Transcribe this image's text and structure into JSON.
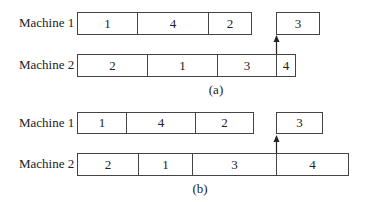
{
  "diagrams": [
    {
      "caption": "(a)",
      "machines": [
        {
          "label": "Machine 1",
          "jobs": [
            "1",
            "4",
            "2"
          ],
          "late_job": "3"
        },
        {
          "label": "Machine 2",
          "jobs": [
            "2",
            "1",
            "3",
            "4"
          ]
        }
      ]
    },
    {
      "caption": "(b)",
      "machines": [
        {
          "label": "Machine 1",
          "jobs": [
            "1",
            "4",
            "2"
          ],
          "late_job": "3"
        },
        {
          "label": "Machine 2",
          "jobs": [
            "2",
            "1",
            "3",
            "4"
          ]
        }
      ]
    }
  ]
}
